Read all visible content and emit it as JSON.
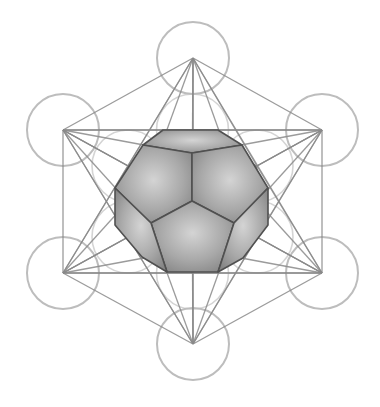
{
  "diagram": {
    "title": "Metatron's Cube with Dodecahedron",
    "colors": {
      "background": "#ffffff",
      "circle_stroke": "#bdbdbd",
      "line_stroke": "#8a8a8a",
      "edge_stroke": "#505050",
      "face_light": "#c8c8c8",
      "face_dark": "#8c8c8c"
    },
    "center": [
      192.5,
      201.5
    ],
    "outer_points": {
      "top": [
        193,
        58
      ],
      "upper_right": [
        322,
        130
      ],
      "lower_right": [
        322,
        273
      ],
      "bottom": [
        193,
        344
      ],
      "lower_left": [
        63,
        273
      ],
      "upper_left": [
        63,
        130
      ]
    },
    "inner_points": {
      "top": [
        192.5,
        130
      ],
      "upper_right": [
        257,
        166
      ],
      "lower_right": [
        257,
        237
      ],
      "bottom": [
        192.5,
        273
      ],
      "lower_left": [
        128,
        237
      ],
      "upper_left": [
        128,
        166
      ]
    },
    "circle_radius": 36,
    "dodecahedron": {
      "faces": [
        {
          "name": "top-face",
          "points": [
            [
              143,
              145
            ],
            [
              163,
              130
            ],
            [
              218,
              130
            ],
            [
              242,
              145
            ],
            [
              192,
              153
            ]
          ]
        },
        {
          "name": "upper-left-face",
          "points": [
            [
              143,
              145
            ],
            [
              192,
              153
            ],
            [
              192,
              201
            ],
            [
              151,
              223
            ],
            [
              115,
              188
            ]
          ]
        },
        {
          "name": "upper-right-face",
          "points": [
            [
              242,
              145
            ],
            [
              268,
              188
            ],
            [
              234,
              223
            ],
            [
              192,
              201
            ],
            [
              192,
              153
            ]
          ]
        },
        {
          "name": "bottom-center-face",
          "points": [
            [
              192,
              201
            ],
            [
              234,
              223
            ],
            [
              218,
              272
            ],
            [
              167,
              272
            ],
            [
              151,
              223
            ]
          ]
        },
        {
          "name": "lower-left-face",
          "points": [
            [
              115,
              188
            ],
            [
              151,
              223
            ],
            [
              167,
              272
            ],
            [
              142,
              257
            ],
            [
              115,
              225
            ]
          ]
        },
        {
          "name": "lower-right-face",
          "points": [
            [
              268,
              188
            ],
            [
              268,
              225
            ],
            [
              243,
              258
            ],
            [
              218,
              272
            ],
            [
              234,
              223
            ]
          ]
        }
      ]
    }
  }
}
